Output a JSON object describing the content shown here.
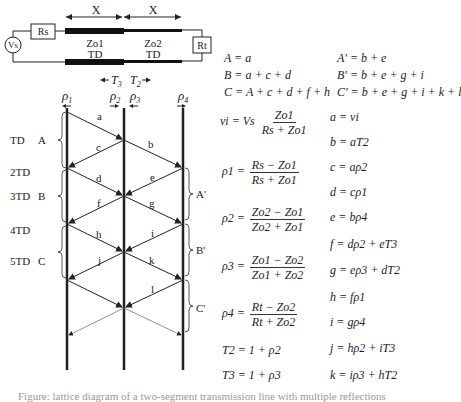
{
  "circuit": {
    "source_label": "Vs",
    "source_resistor": "Rs",
    "termination_resistor": "Rt",
    "segment1": {
      "length_label": "X",
      "impedance_label": "Zo1",
      "delay_label": "TD"
    },
    "segment2": {
      "length_label": "X",
      "impedance_label": "Zo2",
      "delay_label": "TD"
    }
  },
  "lattice": {
    "transmission_labels": {
      "t3": "T3",
      "t2": "T2"
    },
    "reflection_labels": [
      "ρ1",
      "ρ2",
      "ρ3",
      "ρ4"
    ],
    "time_labels": [
      "TD",
      "2TD",
      "3TD",
      "4TD",
      "5TD"
    ],
    "left_groups": [
      "A",
      "B",
      "C"
    ],
    "right_groups": [
      "A'",
      "B'",
      "C'"
    ],
    "wave_labels": [
      "a",
      "b",
      "c",
      "d",
      "e",
      "f",
      "g",
      "h",
      "i",
      "j",
      "k",
      "l"
    ]
  },
  "sums": {
    "left": [
      "A = a",
      "B = a + c + d",
      "C = A + c + d + f + h"
    ],
    "right": [
      "A' = b + e",
      "B' = b + e + g + i",
      "C' = b + e + g + i + k + l"
    ]
  },
  "formulas": {
    "vi": {
      "lhs": "vi = Vs",
      "num": "Zo1",
      "den": "Rs + Zo1"
    },
    "rho1": {
      "lhs": "ρ1 =",
      "num": "Rs − Zo1",
      "den": "Rs + Zo1"
    },
    "rho2": {
      "lhs": "ρ2 =",
      "num": "Zo2 − Zo1",
      "den": "Zo2 + Zo1"
    },
    "rho3": {
      "lhs": "ρ3 =",
      "num": "Zo1 − Zo2",
      "den": "Zo1 + Zo2"
    },
    "rho4": {
      "lhs": "ρ4 =",
      "num": "Rt − Zo2",
      "den": "Rt + Zo2"
    },
    "t2": "T2 = 1 + ρ2",
    "t3": "T3 = 1 + ρ3"
  },
  "wave_equations": [
    "a = vi",
    "b = aT2",
    "c = aρ2",
    "d = cρ1",
    "e = bρ4",
    "f = dρ2 + eT3",
    "g = eρ3 + dT2",
    "h = fρ1",
    "i = gρ4",
    "j = hρ2 + iT3",
    "k = iρ3 + hT2"
  ],
  "caption": "Figure: lattice diagram of a two-segment transmission line with multiple reflections"
}
